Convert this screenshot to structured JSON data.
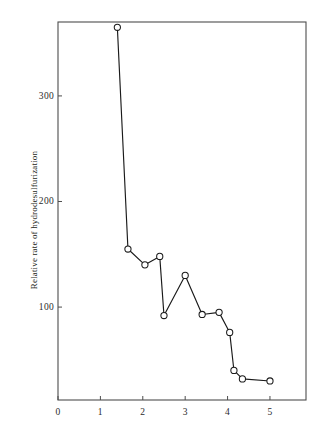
{
  "chart_data": {
    "type": "line",
    "title": "",
    "subtitle": "",
    "xlabel": "",
    "ylabel": "Relative rate of hydrodesulfurization",
    "xlim": [
      0,
      5.85
    ],
    "ylim": [
      12,
      370
    ],
    "xticks": [
      0,
      1,
      2,
      3,
      4,
      5
    ],
    "xtick_labels": [
      "0",
      "1",
      "2",
      "3",
      "4",
      "5"
    ],
    "yticks": [
      100,
      200,
      300
    ],
    "ytick_labels": [
      "100",
      "200",
      "300"
    ],
    "grid": false,
    "legend": "none",
    "marker": "open-circle",
    "line_color": "#1a1a1a",
    "marker_face_color": "#ffffff",
    "marker_edge_color": "#1a1a1a",
    "series": [
      {
        "name": "Relative rate of hydrodesulfurization",
        "x": [
          1.4,
          1.65,
          2.05,
          2.4,
          2.5,
          3.0,
          3.4,
          3.8,
          4.05,
          4.15,
          4.35,
          5.0
        ],
        "y": [
          365,
          155,
          140,
          148,
          92,
          130,
          93,
          95,
          76,
          40,
          32,
          30
        ]
      }
    ]
  },
  "axes": {
    "frame": {
      "left": 58,
      "top": 22,
      "right": 306,
      "bottom": 400
    },
    "tick_length": 4
  }
}
